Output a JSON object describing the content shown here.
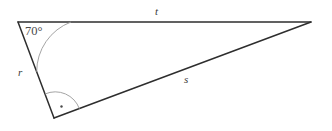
{
  "diagram": {
    "type": "right-triangle",
    "background_color": "#ffffff",
    "stroke_color": "#2e2e2e",
    "arc_color": "#8a8a8a",
    "label_color": "#3a3a3a",
    "vertices": {
      "top_left": {
        "name": "A",
        "x": 18,
        "y": 22
      },
      "top_right": {
        "name": "B",
        "x": 311,
        "y": 22
      },
      "bottom": {
        "name": "C",
        "x": 54,
        "y": 118
      }
    },
    "sides": [
      {
        "id": "t",
        "label": "t",
        "from": "A",
        "to": "B",
        "label_x": 155,
        "label_y": 6
      },
      {
        "id": "r",
        "label": "r",
        "from": "A",
        "to": "C",
        "label_x": 18,
        "label_y": 67
      },
      {
        "id": "s",
        "label": "s",
        "from": "C",
        "to": "B",
        "label_x": 184,
        "label_y": 74
      }
    ],
    "angles": [
      {
        "id": "angle-a",
        "at": "A",
        "label": "70°",
        "value": 70,
        "unit": "degrees",
        "marker": "arc",
        "label_x": 25,
        "label_y": 25
      },
      {
        "id": "angle-c",
        "at": "C",
        "label": "",
        "value": 90,
        "unit": "degrees",
        "marker": "right-angle-arc-with-dot"
      }
    ]
  }
}
